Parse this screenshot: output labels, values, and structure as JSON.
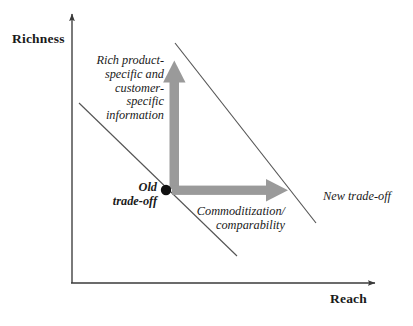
{
  "figure": {
    "type": "diagram",
    "kind": "two-axis-conceptual-tradeoff",
    "background_color": "#ffffff",
    "axis_color": "#3a3a3a",
    "line_color": "#555555",
    "arrow_color": "#9a9a9a",
    "dot_color": "#111111",
    "text_color": "#1a1a1a"
  },
  "axes": {
    "y": {
      "label": "Richness"
    },
    "x": {
      "label": "Reach"
    }
  },
  "annotations": {
    "vertical_arrow_caption": "Rich product-\nspecific and\ncustomer-\nspecific\ninformation",
    "vertical_arrow_caption_lines": [
      "Rich product-",
      "specific and",
      "customer-",
      "specific",
      "information"
    ],
    "origin_point_label": "Old\ntrade-off",
    "origin_point_label_lines": [
      "Old",
      "trade-off"
    ],
    "horizontal_arrow_caption": "Commoditization/\ncomparability",
    "horizontal_arrow_caption_lines": [
      "Commoditization/",
      "comparability"
    ],
    "new_frontier_label": "New trade-off"
  },
  "frontiers": [
    {
      "name": "old-trade-off-frontier",
      "from": [
        79,
        103
      ],
      "to": [
        237,
        256
      ]
    },
    {
      "name": "new-trade-off-frontier",
      "from": [
        175,
        43
      ],
      "to": [
        316,
        223
      ]
    }
  ],
  "movement_arrows": [
    {
      "name": "richness-increase-arrow",
      "direction": "up",
      "from": [
        174,
        189
      ],
      "to": [
        174,
        61
      ]
    },
    {
      "name": "reach-increase-arrow",
      "direction": "right",
      "from": [
        172,
        190
      ],
      "to": [
        287,
        190
      ]
    }
  ],
  "point": {
    "name": "old-trade-off-point",
    "at": [
      166,
      190
    ]
  }
}
